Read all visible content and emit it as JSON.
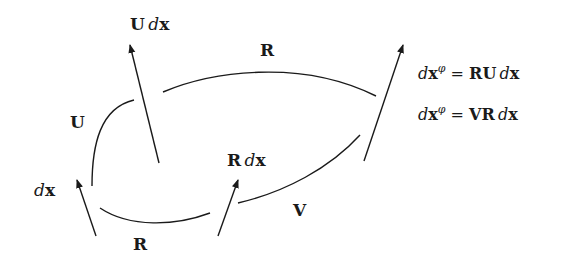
{
  "diagram": {
    "vectors": [
      {
        "id": "dx",
        "label_d": "d",
        "label_x": "x",
        "label_prefix": ""
      },
      {
        "id": "U_dx",
        "label_prefix": "U",
        "label_d": "d",
        "label_x": "x"
      },
      {
        "id": "R_dx",
        "label_prefix": "R",
        "label_d": "d",
        "label_x": "x"
      },
      {
        "id": "dx_phi",
        "label_d": "d",
        "label_x": "x",
        "label_sup": "φ"
      }
    ],
    "transforms": {
      "left_arc": "U",
      "top_arc": "R",
      "bottom_arc": "R",
      "right_arc": "V"
    },
    "equations": [
      {
        "lhs_d": "d",
        "lhs_x": "x",
        "lhs_sup": "φ",
        "eq": "=",
        "rhs_ops": "RU",
        "rhs_d": "d",
        "rhs_x": "x"
      },
      {
        "lhs_d": "d",
        "lhs_x": "x",
        "lhs_sup": "φ",
        "eq": "=",
        "rhs_ops": "VR",
        "rhs_d": "d",
        "rhs_x": "x"
      }
    ],
    "stroke_color": "#1a1a1a",
    "background": "#ffffff"
  }
}
